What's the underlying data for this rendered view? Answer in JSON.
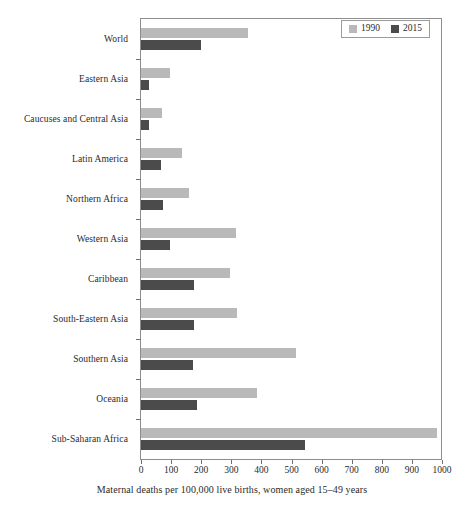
{
  "chart_data": {
    "type": "bar",
    "orientation": "horizontal",
    "title": "",
    "xlabel": "Maternal deaths per 100,000 live births, women aged 15–49 years",
    "ylabel": "",
    "xlim": [
      0,
      1000
    ],
    "xticks": [
      0,
      100,
      200,
      300,
      400,
      500,
      600,
      700,
      800,
      900,
      1000
    ],
    "grid": false,
    "legend_position": "top-right",
    "categories": [
      "World",
      "Eastern Asia",
      "Caucuses and Central Asia",
      "Latin America",
      "Northern Africa",
      "Western Asia",
      "Caribbean",
      "South-Eastern Asia",
      "Southern Asia",
      "Oceania",
      "Sub-Saharan Africa"
    ],
    "series": [
      {
        "name": "1990",
        "color": "#b9b9b9",
        "values": [
          355,
          95,
          70,
          135,
          160,
          315,
          295,
          320,
          515,
          385,
          985
        ]
      },
      {
        "name": "2015",
        "color": "#4b4b4b",
        "values": [
          200,
          27,
          25,
          67,
          72,
          95,
          175,
          175,
          172,
          187,
          545
        ]
      }
    ]
  },
  "legend": {
    "items": [
      {
        "label": "1990",
        "swatch_name": "legend-swatch-1990"
      },
      {
        "label": "2015",
        "swatch_name": "legend-swatch-2015"
      }
    ]
  }
}
